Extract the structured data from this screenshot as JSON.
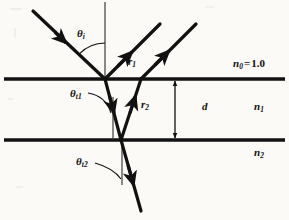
{
  "figure": {
    "background_color": "#fbfaf7",
    "ink_color": "#111111"
  },
  "labels": {
    "theta_i": {
      "symbol": "θ",
      "sub": "i",
      "x": 77,
      "y": 28
    },
    "theta_t1": {
      "symbol": "θ",
      "sub": "t1",
      "x": 72,
      "y": 90
    },
    "theta_t2": {
      "symbol": "θ",
      "sub": "t2",
      "x": 78,
      "y": 158
    },
    "r1": {
      "symbol": "r",
      "sub": "1",
      "x": 128,
      "y": 57
    },
    "r2": {
      "symbol": "r",
      "sub": "2",
      "x": 141,
      "y": 101
    },
    "n0": {
      "symbol": "n",
      "sub": "0",
      "equals": "=",
      "value": "1.0",
      "x": 236,
      "y": 60
    },
    "n1": {
      "symbol": "n",
      "sub": "1",
      "x": 255,
      "y": 102
    },
    "n2": {
      "symbol": "n",
      "sub": "2",
      "x": 255,
      "y": 148
    },
    "d": {
      "symbol": "d",
      "x": 203,
      "y": 102
    }
  },
  "geometry": {
    "interfaces": [
      {
        "name": "upper-interface",
        "y": 79,
        "x1": 4,
        "x2": 285
      },
      {
        "name": "lower-interface",
        "y": 140,
        "x1": 4,
        "x2": 285
      }
    ],
    "normals": [
      {
        "name": "normal-top",
        "x": 105,
        "y1": 2,
        "y2": 79
      },
      {
        "name": "normal-middle",
        "x": 113,
        "y1": 97,
        "y2": 140
      },
      {
        "name": "normal-bottom",
        "x": 122,
        "y1": 140,
        "y2": 185
      }
    ],
    "rays": [
      {
        "name": "incident-ray",
        "x1": 33,
        "y1": 11,
        "x2": 105,
        "y2": 79
      },
      {
        "name": "reflected-ray-r1",
        "x1": 105,
        "y1": 79,
        "x2": 160,
        "y2": 24
      },
      {
        "name": "reflected-ray-r2",
        "x1": 141,
        "y1": 79,
        "x2": 196,
        "y2": 24
      },
      {
        "name": "refracted-ray-down",
        "x1": 105,
        "y1": 79,
        "x2": 121,
        "y2": 140
      },
      {
        "name": "internal-ray-up",
        "x1": 121,
        "y1": 140,
        "x2": 141,
        "y2": 79
      },
      {
        "name": "transmitted-ray",
        "x1": 121,
        "y1": 140,
        "x2": 141,
        "y2": 211
      }
    ],
    "thickness_dimension": {
      "name": "d-arrow",
      "x": 175,
      "y_top": 81,
      "y_bottom": 138
    }
  }
}
